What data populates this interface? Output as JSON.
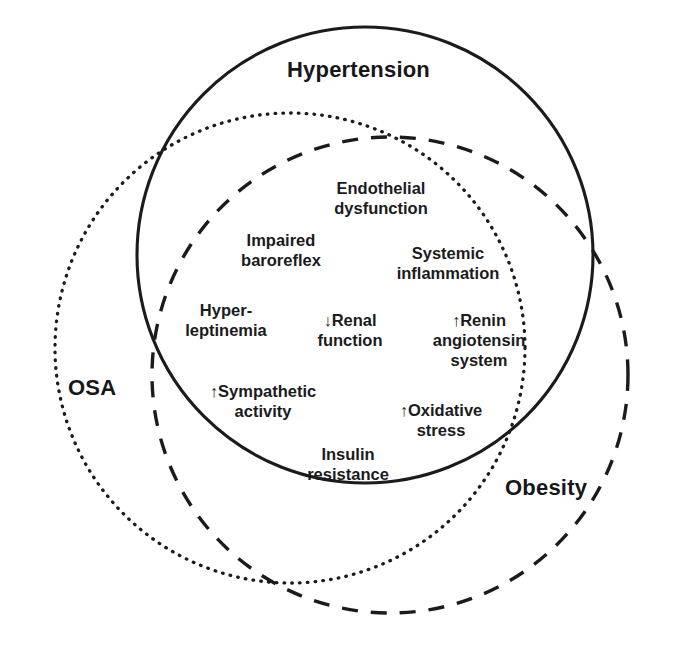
{
  "figure": {
    "type": "venn-diagram",
    "background_color": "#ffffff",
    "stroke_color": "#1b1b1e"
  },
  "sets": [
    {
      "key": "hypertension",
      "label": "Hypertension",
      "line_style": "solid",
      "cx": 365,
      "cy": 255,
      "r": 228,
      "label_x": 287,
      "label_y": 58
    },
    {
      "key": "osa",
      "label": "OSA",
      "line_style": "dotted",
      "cx": 290,
      "cy": 348,
      "r": 235,
      "label_x": 68,
      "label_y": 376
    },
    {
      "key": "obesity",
      "label": "Obesity",
      "line_style": "dashed",
      "cx": 390,
      "cy": 375,
      "r": 238,
      "label_x": 505,
      "label_y": 476
    }
  ],
  "shared_factors": [
    {
      "key": "endothelial-dysfunction",
      "lines": [
        "Endothelial",
        "dysfunction"
      ],
      "arrow": "",
      "x": 381,
      "y": 178
    },
    {
      "key": "impaired-baroreflex",
      "lines": [
        "Impaired",
        "baroreflex"
      ],
      "arrow": "",
      "x": 281,
      "y": 230
    },
    {
      "key": "systemic-inflammation",
      "lines": [
        "Systemic",
        "inflammation"
      ],
      "arrow": "",
      "x": 448,
      "y": 243
    },
    {
      "key": "hyperleptinemia",
      "lines": [
        "Hyper-",
        "leptinemia"
      ],
      "arrow": "",
      "x": 226,
      "y": 300
    },
    {
      "key": "renal-function",
      "lines": [
        "↓Renal",
        "function"
      ],
      "arrow": "↓",
      "x": 350,
      "y": 310
    },
    {
      "key": "renin-angiotensin-system",
      "lines": [
        "↑Renin",
        "angiotensin",
        "system"
      ],
      "arrow": "↑",
      "x": 479,
      "y": 310
    },
    {
      "key": "sympathetic-activity",
      "lines": [
        "↑Sympathetic",
        "activity"
      ],
      "arrow": "↑",
      "x": 263,
      "y": 381
    },
    {
      "key": "oxidative-stress",
      "lines": [
        "↑Oxidative",
        "stress"
      ],
      "arrow": "↑",
      "x": 441,
      "y": 400
    },
    {
      "key": "insulin-resistance",
      "lines": [
        "Insulin",
        "resistance"
      ],
      "arrow": "",
      "x": 348,
      "y": 444
    }
  ]
}
